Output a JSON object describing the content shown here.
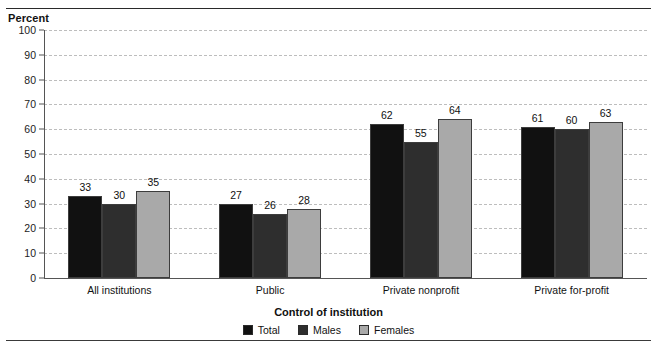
{
  "figure": {
    "percent_label": "Percent",
    "axis_title": "Control of institution"
  },
  "chart_data": {
    "type": "bar",
    "title": "",
    "xlabel": "Control of institution",
    "ylabel": "Percent",
    "ylim": [
      0,
      100
    ],
    "ytick_step": 10,
    "yticks": [
      "100",
      "90",
      "80",
      "70",
      "60",
      "50",
      "40",
      "30",
      "20",
      "10",
      "0"
    ],
    "grid": true,
    "legend_position": "bottom-center",
    "categories": [
      "All institutions",
      "Public",
      "Private nonprofit",
      "Private for-profit"
    ],
    "series": [
      {
        "name": "Total",
        "color": "#111111",
        "values": [
          33,
          30,
          62,
          61
        ]
      },
      {
        "name": "Males",
        "color": "#2e2e2e",
        "values": [
          30,
          26,
          55,
          60
        ]
      },
      {
        "name": "Females",
        "color": "#a9a9a9",
        "values": [
          35,
          28,
          64,
          63
        ]
      }
    ],
    "data_labels": [
      [
        "33",
        "30",
        "35"
      ],
      [
        "27",
        "26",
        "28"
      ],
      [
        "62",
        "55",
        "64"
      ],
      [
        "61",
        "60",
        "63"
      ]
    ]
  },
  "note": ""
}
